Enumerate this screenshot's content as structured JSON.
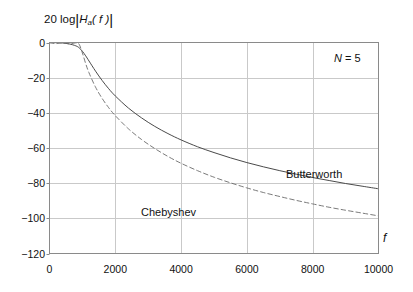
{
  "chart_data": {
    "type": "line",
    "title": "",
    "ylabel": "20 log|Ha(f)|",
    "xlabel": "f",
    "xlim": [
      0,
      10000
    ],
    "ylim": [
      -120,
      0
    ],
    "xticks": [
      0,
      2000,
      4000,
      6000,
      8000,
      10000
    ],
    "yticks": [
      0,
      -20,
      -40,
      -60,
      -80,
      -100,
      -120
    ],
    "xtick_labels": [
      "0",
      "2000",
      "4000",
      "6000",
      "8000",
      "10000"
    ],
    "ytick_labels": [
      "0",
      "−20",
      "−40",
      "−60",
      "−80",
      "−100",
      "−120"
    ],
    "grid": true,
    "legend_position": "inline-annotations",
    "annotations": [
      {
        "text": "N = 5",
        "x": 8400,
        "y": -6
      },
      {
        "text": "Butterworth",
        "x": 7000,
        "y": -72
      },
      {
        "text": "Chebyshev",
        "x": 2600,
        "y": -94
      }
    ],
    "series": [
      {
        "name": "Butterworth",
        "style": "solid",
        "color": "#4a4a4a",
        "x": [
          0,
          200,
          400,
          600,
          800,
          900,
          1000,
          1100,
          1200,
          1400,
          1600,
          1800,
          2000,
          2400,
          2800,
          3200,
          3600,
          4000,
          4500,
          5000,
          5500,
          6000,
          6500,
          7000,
          7500,
          8000,
          8500,
          9000,
          9500,
          10000
        ],
        "y": [
          0,
          -0.1,
          -0.3,
          -0.8,
          -1.9,
          -3.0,
          -5.0,
          -7.6,
          -10.5,
          -16.3,
          -21.6,
          -26.3,
          -30.4,
          -37.3,
          -42.9,
          -47.7,
          -51.8,
          -55.4,
          -59.3,
          -62.6,
          -65.6,
          -68.3,
          -70.7,
          -72.9,
          -74.9,
          -76.8,
          -78.5,
          -80.2,
          -81.7,
          -83.2
        ]
      },
      {
        "name": "Chebyshev",
        "style": "dashed",
        "color": "#6b6b6b",
        "x": [
          0,
          200,
          400,
          600,
          800,
          900,
          1000,
          1100,
          1200,
          1400,
          1600,
          1800,
          2000,
          2400,
          2800,
          3200,
          3600,
          4000,
          4500,
          5000,
          5500,
          6000,
          6500,
          7000,
          7500,
          8000,
          8500,
          9000,
          9500,
          10000
        ],
        "y": [
          -0.2,
          -0.6,
          -0.1,
          -0.8,
          -0.2,
          -1.0,
          -6.0,
          -12.0,
          -17.2,
          -25.4,
          -31.8,
          -37.1,
          -41.6,
          -49.1,
          -55.2,
          -60.3,
          -64.8,
          -68.7,
          -72.9,
          -76.6,
          -79.8,
          -82.7,
          -85.3,
          -87.6,
          -89.8,
          -91.8,
          -93.7,
          -95.4,
          -97.0,
          -98.6
        ]
      }
    ]
  },
  "ylabel_parts": {
    "prefix": "20 log",
    "h": "H",
    "sub": "a",
    "arg": "( f )"
  },
  "annotations": {
    "n_label_var": "N",
    "n_label_value": "= 5",
    "butterworth": "Butterworth",
    "chebyshev": "Chebyshev",
    "f_axis": "f"
  },
  "colors": {
    "grid": "#c9c9c9",
    "frame": "#8a8a8a",
    "butterworth": "#4a4a4a",
    "chebyshev": "#6b6b6b",
    "text": "#111111",
    "background": "#ffffff"
  }
}
